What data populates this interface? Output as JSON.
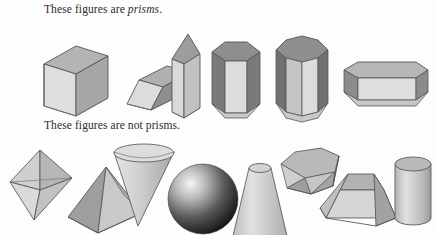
{
  "page": {
    "background_color": "#fdfdfd",
    "width": 437,
    "height": 235
  },
  "captions": {
    "prisms": {
      "lead_text": "These figures are ",
      "emphasis_text": "prisms",
      "trailing_text": "."
    },
    "not_prisms": {
      "full_text": "These figures are not prisms."
    }
  },
  "palette": {
    "outline": "#555555",
    "face_light": "#e2e2e2",
    "face_mid": "#c6c6c6",
    "face_dark": "#9a9a9a",
    "face_darker": "#7b7b7b",
    "sphere_highlight": "#f2f2f2",
    "sphere_shadow": "#1d1d1d",
    "text_color": "#2b2b2b"
  },
  "rows": {
    "prisms": {
      "label": "Row of prism figures",
      "figures": [
        {
          "id": "rectangular-prism",
          "name": "rectangular prism",
          "order": 1
        },
        {
          "id": "oblique-parallelepiped",
          "name": "oblique parallelepiped prism",
          "order": 2
        },
        {
          "id": "triangular-prism",
          "name": "triangular prism",
          "order": 3
        },
        {
          "id": "hexagonal-prism",
          "name": "hexagonal prism",
          "order": 4
        },
        {
          "id": "octagonal-prism",
          "name": "octagonal prism",
          "order": 5
        },
        {
          "id": "horizontal-hexagonal-prism",
          "name": "horizontal hexagonal prism",
          "order": 6
        }
      ]
    },
    "not_prisms": {
      "label": "Row of non-prism figures",
      "figures": [
        {
          "id": "octahedron",
          "name": "octahedron bipyramid",
          "order": 1
        },
        {
          "id": "square-pyramid",
          "name": "square pyramid",
          "order": 2
        },
        {
          "id": "cone",
          "name": "cone",
          "order": 3
        },
        {
          "id": "sphere",
          "name": "sphere",
          "order": 4
        },
        {
          "id": "truncated-cone",
          "name": "truncated cone frustum",
          "order": 5
        },
        {
          "id": "hexagonal-antiprism",
          "name": "hexagonal antiprism",
          "order": 6
        },
        {
          "id": "truncated-pyramid",
          "name": "truncated pyramid frustum",
          "order": 7
        },
        {
          "id": "cylinder",
          "name": "cylinder",
          "order": 8
        }
      ]
    }
  }
}
